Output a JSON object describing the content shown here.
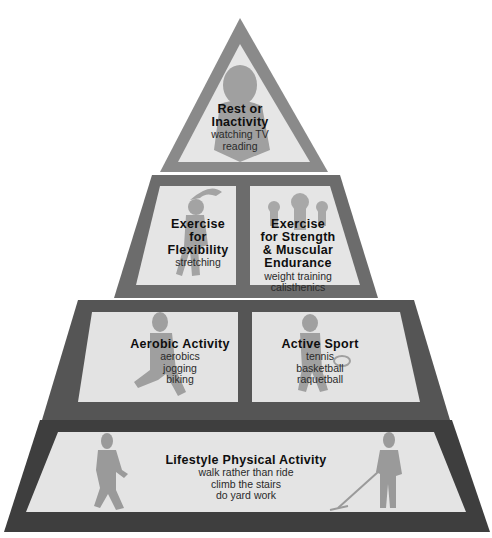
{
  "colors": {
    "top_tier_border": "#8a8a8a",
    "mid_tier_border": "#6c6c6c",
    "lower_tier_border": "#555555",
    "base_tier_border": "#3e3e3e",
    "panel_fill": "#e6e6e6",
    "figure_fill": "#9a9a9a",
    "title_text": "#0e0e0e",
    "sub_text": "#2a2a2a"
  },
  "pyramid": {
    "tier1": {
      "title_line1": "Rest or",
      "title_line2": "Inactivity",
      "items": [
        "watching TV",
        "reading"
      ]
    },
    "tier2": {
      "left": {
        "title_line1": "Exercise",
        "title_line2": "for",
        "title_line3": "Flexibility",
        "items": [
          "stretching"
        ]
      },
      "right": {
        "title_line1": "Exercise",
        "title_line2": "for Strength",
        "title_line3": "& Muscular",
        "title_line4": "Endurance",
        "items": [
          "weight training",
          "calisthenics"
        ]
      }
    },
    "tier3": {
      "left": {
        "title": "Aerobic Activity",
        "items": [
          "aerobics",
          "jogging",
          "biking"
        ]
      },
      "right": {
        "title": "Active Sport",
        "items": [
          "tennis",
          "basketball",
          "raquetball"
        ]
      }
    },
    "tier4": {
      "title": "Lifestyle Physical Activity",
      "items": [
        "walk rather than ride",
        "climb the stairs",
        "do yard work"
      ]
    }
  }
}
